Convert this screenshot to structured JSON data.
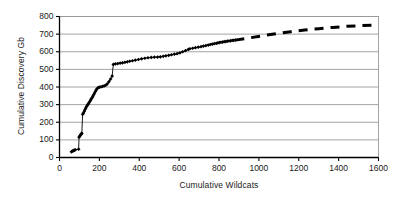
{
  "chart_data": {
    "type": "scatter",
    "title": "",
    "xlabel": "Cumulative Wildcats",
    "ylabel": "Cumulative Discovery Gb",
    "xlim": [
      0,
      1600
    ],
    "ylim": [
      0,
      800
    ],
    "xticks": [
      0,
      200,
      400,
      600,
      800,
      1000,
      1200,
      1400,
      1600
    ],
    "yticks": [
      0,
      100,
      200,
      300,
      400,
      500,
      600,
      700,
      800
    ],
    "grid": "horizontal",
    "legend": "none",
    "marker": "filled-diamond",
    "marker_color": "#000000",
    "line_color": "#000000",
    "series": [
      {
        "name": "Observed cumulative discovery",
        "style": "solid-with-markers",
        "points": [
          [
            60,
            32
          ],
          [
            64,
            36
          ],
          [
            68,
            38
          ],
          [
            72,
            40
          ],
          [
            76,
            42
          ],
          [
            80,
            44
          ],
          [
            96,
            47
          ],
          [
            98,
            115
          ],
          [
            101,
            120
          ],
          [
            104,
            126
          ],
          [
            107,
            131
          ],
          [
            110,
            134
          ],
          [
            112,
            137
          ],
          [
            116,
            245
          ],
          [
            120,
            252
          ],
          [
            124,
            262
          ],
          [
            128,
            272
          ],
          [
            132,
            281
          ],
          [
            136,
            290
          ],
          [
            140,
            297
          ],
          [
            144,
            303
          ],
          [
            148,
            310
          ],
          [
            152,
            318
          ],
          [
            156,
            326
          ],
          [
            160,
            333
          ],
          [
            164,
            341
          ],
          [
            168,
            349
          ],
          [
            172,
            357
          ],
          [
            176,
            366
          ],
          [
            180,
            375
          ],
          [
            184,
            383
          ],
          [
            188,
            390
          ],
          [
            194,
            396
          ],
          [
            200,
            399
          ],
          [
            208,
            401
          ],
          [
            216,
            403
          ],
          [
            224,
            406
          ],
          [
            232,
            410
          ],
          [
            240,
            418
          ],
          [
            248,
            430
          ],
          [
            256,
            445
          ],
          [
            264,
            462
          ],
          [
            270,
            528
          ],
          [
            280,
            531
          ],
          [
            292,
            533
          ],
          [
            304,
            535
          ],
          [
            316,
            537
          ],
          [
            328,
            540
          ],
          [
            340,
            543
          ],
          [
            352,
            546
          ],
          [
            366,
            549
          ],
          [
            380,
            552
          ],
          [
            396,
            556
          ],
          [
            412,
            560
          ],
          [
            428,
            563
          ],
          [
            444,
            566
          ],
          [
            460,
            568
          ],
          [
            476,
            569
          ],
          [
            492,
            570
          ],
          [
            506,
            571
          ],
          [
            520,
            574
          ],
          [
            534,
            577
          ],
          [
            548,
            580
          ],
          [
            562,
            583
          ],
          [
            576,
            586
          ],
          [
            590,
            589
          ],
          [
            604,
            594
          ],
          [
            618,
            600
          ],
          [
            632,
            606
          ],
          [
            646,
            613
          ],
          [
            654,
            617
          ],
          [
            668,
            620
          ],
          [
            682,
            623
          ],
          [
            696,
            626
          ],
          [
            710,
            629
          ],
          [
            722,
            632
          ],
          [
            734,
            635
          ],
          [
            746,
            638
          ],
          [
            756,
            641
          ],
          [
            766,
            643
          ],
          [
            776,
            646
          ],
          [
            786,
            648
          ],
          [
            794,
            650
          ],
          [
            802,
            652
          ],
          [
            810,
            654
          ],
          [
            818,
            655
          ],
          [
            826,
            657
          ],
          [
            834,
            658
          ],
          [
            842,
            660
          ],
          [
            850,
            661
          ],
          [
            858,
            662
          ],
          [
            866,
            664
          ],
          [
            874,
            665
          ],
          [
            882,
            666
          ]
        ]
      },
      {
        "name": "Extrapolated trend",
        "style": "dashed",
        "points": [
          [
            882,
            666
          ],
          [
            950,
            678
          ],
          [
            1020,
            691
          ],
          [
            1090,
            703
          ],
          [
            1160,
            714
          ],
          [
            1230,
            723
          ],
          [
            1300,
            731
          ],
          [
            1370,
            738
          ],
          [
            1440,
            744
          ],
          [
            1510,
            748
          ],
          [
            1570,
            751
          ]
        ]
      }
    ]
  },
  "axes": {
    "ylabel": "Cumulative Discovery Gb",
    "xlabel": "Cumulative Wildcats",
    "yticks": [
      "800",
      "700",
      "600",
      "500",
      "400",
      "300",
      "200",
      "100",
      "0"
    ],
    "xticks": [
      "0",
      "200",
      "400",
      "600",
      "800",
      "1000",
      "1200",
      "1400",
      "1600"
    ]
  },
  "colors": {
    "ink": "#000000",
    "grid": "#8c8c8c",
    "frame": "#9a9a9a",
    "background": "#ffffff"
  }
}
